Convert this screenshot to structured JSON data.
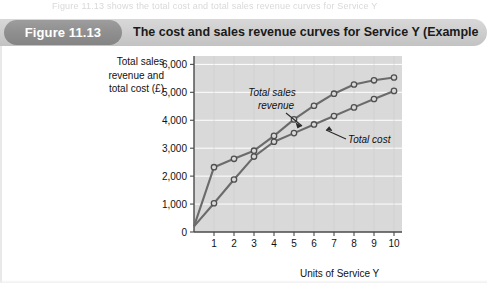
{
  "page": {
    "running_text_top": "Figure 11.13 shows the total cost and total sales revenue curves for Service Y"
  },
  "header": {
    "badge_label": "Figure 11.13",
    "title": "The cost and sales revenue curves for Service Y (Example 11.5)",
    "badge_color": "#8f8f8f",
    "bar_color": "#cfcfcf"
  },
  "chart_data": {
    "type": "line",
    "title": "The cost and sales revenue curves for Service Y (Example 11.5)",
    "xlabel": "Units of Service Y",
    "ylabel": "Total sales revenue and total cost (£)",
    "ylabel_lines": [
      "Total sales",
      "revenue and",
      "total cost (£)"
    ],
    "x": [
      0,
      1,
      2,
      3,
      4,
      5,
      6,
      7,
      8,
      9,
      10
    ],
    "xticks": [
      1,
      2,
      3,
      4,
      5,
      6,
      7,
      8,
      9,
      10
    ],
    "xticklabels": [
      "1",
      "2",
      "3",
      "4",
      "5",
      "6",
      "7",
      "8",
      "9",
      "10"
    ],
    "yticks": [
      0,
      1000,
      2000,
      3000,
      4000,
      5000,
      6000
    ],
    "yticklabels": [
      "0",
      "1,000",
      "2,000",
      "3,000",
      "4,000",
      "5,000",
      "6,000"
    ],
    "xlim": [
      0,
      10.4
    ],
    "ylim": [
      0,
      6300
    ],
    "grid": "horizontal",
    "legend": "none",
    "plot_background": "#d9d9d9",
    "gridline_color": "#ffffff",
    "line_color": "#6b6b6b",
    "marker_fill": "#d8d8d8",
    "marker_edge": "#4f4f4f",
    "series": [
      {
        "name": "Total sales revenue",
        "values": [
          200,
          2320,
          2620,
          2910,
          3440,
          4030,
          4520,
          4950,
          5280,
          5430,
          5530
        ],
        "annotation": "Total sales revenue",
        "annotation_lines": [
          "Total sales",
          "revenue"
        ]
      },
      {
        "name": "Total cost",
        "values": [
          200,
          1030,
          1880,
          2700,
          3230,
          3540,
          3850,
          4150,
          4460,
          4760,
          5050
        ],
        "annotation": "Total cost",
        "annotation_lines": [
          "Total cost"
        ]
      }
    ]
  }
}
